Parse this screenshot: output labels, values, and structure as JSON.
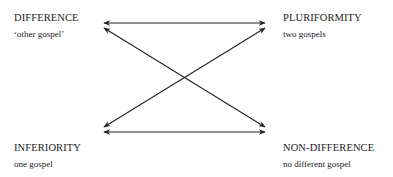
{
  "diagram": {
    "nodes": [
      {
        "id": "tl",
        "title": "DIFFERENCE",
        "subtitle": "‘other gospel’"
      },
      {
        "id": "tr",
        "title": "PLURIFORMITY",
        "subtitle": "two gospels"
      },
      {
        "id": "bl",
        "title": "INFERIORITY",
        "subtitle": "one gospel"
      },
      {
        "id": "br",
        "title": "NON-DIFFERENCE",
        "subtitle": "no different gospel"
      }
    ],
    "edges": [
      {
        "from": "tl",
        "to": "tr",
        "type": "double-arrow"
      },
      {
        "from": "bl",
        "to": "br",
        "type": "double-arrow"
      },
      {
        "from": "tl",
        "to": "br",
        "type": "double-arrow"
      },
      {
        "from": "bl",
        "to": "tr",
        "type": "double-arrow"
      }
    ],
    "line_color": "#222222"
  }
}
